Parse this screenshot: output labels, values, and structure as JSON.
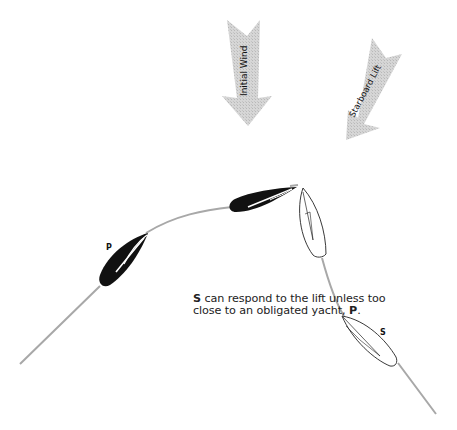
{
  "diagram": {
    "arrows": [
      {
        "id": "initial-wind",
        "label": "Initial Wind",
        "color": "#c8c8c8"
      },
      {
        "id": "starboard-lift",
        "label": "Starboard Lift",
        "color": "#c8c8c8"
      }
    ],
    "boats": [
      {
        "id": "port-boat",
        "label": "P",
        "fill": "#111111"
      },
      {
        "id": "starboard-boat",
        "label": "S",
        "fill": "#ffffff"
      }
    ],
    "caption": {
      "subject": "S",
      "line1_rest": " can respond to the lift unless too",
      "line2": "close to an obligated yacht, ",
      "obligated": "P",
      "period": "."
    }
  }
}
